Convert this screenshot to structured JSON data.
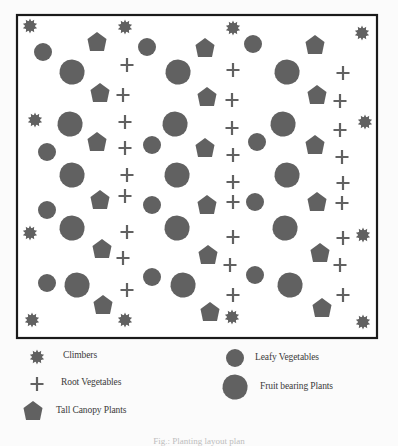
{
  "diagram": {
    "title": "Planting layout",
    "symbol_color": "#616161",
    "border_color": "#1a1a1a",
    "plot_frame": {
      "x": 17,
      "y": 15,
      "width": 360,
      "height": 323
    },
    "plants": {
      "climbers": [
        [
          30,
          26
        ],
        [
          125,
          27
        ],
        [
          233,
          28
        ],
        [
          362,
          33
        ],
        [
          35,
          120
        ],
        [
          365,
          122
        ],
        [
          30,
          233
        ],
        [
          363,
          235
        ],
        [
          32,
          320
        ],
        [
          125,
          320
        ],
        [
          232,
          317
        ],
        [
          363,
          322
        ]
      ],
      "leafy_vegetables": [
        [
          43,
          52
        ],
        [
          147,
          47
        ],
        [
          253,
          44
        ],
        [
          47,
          152
        ],
        [
          152,
          145
        ],
        [
          257,
          142
        ],
        [
          47,
          210
        ],
        [
          152,
          205
        ],
        [
          255,
          202
        ],
        [
          47,
          283
        ],
        [
          152,
          277
        ],
        [
          255,
          275
        ]
      ],
      "fruit_bearing_plants": [
        [
          72,
          72
        ],
        [
          178,
          72
        ],
        [
          287,
          72
        ],
        [
          70,
          124
        ],
        [
          175,
          124
        ],
        [
          283,
          124
        ],
        [
          72,
          175
        ],
        [
          177,
          175
        ],
        [
          287,
          175
        ],
        [
          72,
          228
        ],
        [
          177,
          228
        ],
        [
          285,
          228
        ],
        [
          77,
          285
        ],
        [
          183,
          285
        ],
        [
          290,
          285
        ]
      ],
      "tall_canopy_plants": [
        [
          97,
          42
        ],
        [
          205,
          48
        ],
        [
          315,
          45
        ],
        [
          100,
          93
        ],
        [
          207,
          97
        ],
        [
          317,
          95
        ],
        [
          97,
          142
        ],
        [
          205,
          148
        ],
        [
          315,
          145
        ],
        [
          100,
          200
        ],
        [
          207,
          205
        ],
        [
          317,
          202
        ],
        [
          102,
          249
        ],
        [
          208,
          255
        ],
        [
          320,
          253
        ],
        [
          103,
          305
        ],
        [
          210,
          312
        ],
        [
          322,
          308
        ]
      ],
      "root_vegetables": [
        [
          127,
          65
        ],
        [
          123,
          95
        ],
        [
          125,
          122
        ],
        [
          125,
          148
        ],
        [
          127,
          175
        ],
        [
          125,
          196
        ],
        [
          127,
          232
        ],
        [
          123,
          258
        ],
        [
          127,
          290
        ],
        [
          233,
          70
        ],
        [
          232,
          100
        ],
        [
          232,
          128
        ],
        [
          233,
          155
        ],
        [
          233,
          182
        ],
        [
          233,
          202
        ],
        [
          233,
          237
        ],
        [
          230,
          265
        ],
        [
          233,
          295
        ],
        [
          343,
          73
        ],
        [
          340,
          101
        ],
        [
          340,
          130
        ],
        [
          342,
          157
        ],
        [
          343,
          183
        ],
        [
          342,
          203
        ],
        [
          343,
          238
        ],
        [
          340,
          265
        ],
        [
          343,
          295
        ]
      ]
    }
  },
  "legend": {
    "items": [
      {
        "key": "climbers",
        "label": "Climbers",
        "icon": "climber-icon",
        "icon_pos": [
          37,
          357
        ],
        "label_pos": [
          63,
          351
        ]
      },
      {
        "key": "root_vegetables",
        "label": "Root Vegetables",
        "icon": "plus-icon",
        "icon_pos": [
          37,
          384
        ],
        "label_pos": [
          61,
          378
        ]
      },
      {
        "key": "tall_canopy_plants",
        "label": "Tall Canopy Plants",
        "icon": "pentagon-icon",
        "icon_pos": [
          33,
          411
        ],
        "label_pos": [
          56,
          406
        ]
      },
      {
        "key": "leafy_vegetables",
        "label": "Leafy Vegetables",
        "icon": "circle-icon",
        "icon_pos": [
          235,
          358
        ],
        "label_pos": [
          255,
          353
        ]
      },
      {
        "key": "fruit_bearing_plants",
        "label": "Fruit bearing Plants",
        "icon": "blob-icon",
        "icon_pos": [
          235,
          387
        ],
        "label_pos": [
          260,
          382
        ]
      }
    ]
  },
  "caption": "Fig.: Planting layout plan"
}
